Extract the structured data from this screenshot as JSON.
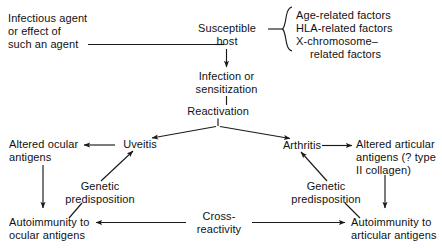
{
  "diagram": {
    "type": "flowchart",
    "title": "",
    "colors": {
      "background": "#ffffff",
      "text": "#111111",
      "stroke": "#1a1a1a"
    },
    "nodes": [
      {
        "id": "infectious-agent",
        "lines": [
          "Infectious agent",
          "or effect of",
          "such an agent"
        ]
      },
      {
        "id": "susceptible-host",
        "lines": [
          "Susceptible",
          "host"
        ]
      },
      {
        "id": "age-related-factors",
        "lines": [
          "Age-related factors"
        ]
      },
      {
        "id": "hla-related-factors",
        "lines": [
          "HLA-related factors"
        ]
      },
      {
        "id": "x-chromosome-factors",
        "lines": [
          "X-chromosome–",
          "related factors"
        ]
      },
      {
        "id": "infection-sensitization",
        "lines": [
          "Infection or",
          "sensitization"
        ]
      },
      {
        "id": "reactivation",
        "lines": [
          "Reactivation"
        ]
      },
      {
        "id": "uveitis",
        "lines": [
          "Uveitis"
        ]
      },
      {
        "id": "arthritis",
        "lines": [
          "Arthritis"
        ]
      },
      {
        "id": "altered-ocular-antigens",
        "lines": [
          "Altered ocular",
          "antigens"
        ]
      },
      {
        "id": "altered-articular-antigens",
        "lines": [
          "Altered articular",
          "antigens (? type",
          "II collagen)"
        ]
      },
      {
        "id": "genetic-predisposition-ocular",
        "lines": [
          "Genetic",
          "predisposition"
        ]
      },
      {
        "id": "genetic-predisposition-articular",
        "lines": [
          "Genetic",
          "predisposition"
        ]
      },
      {
        "id": "autoimmunity-ocular",
        "lines": [
          "Autoimmunity to",
          "ocular antigens"
        ]
      },
      {
        "id": "autoimmunity-articular",
        "lines": [
          "Autoimmunity to",
          "articular antigens"
        ]
      },
      {
        "id": "cross-reactivity",
        "lines": [
          "Cross-",
          "reactivity"
        ]
      }
    ],
    "edges": [
      {
        "from": "infectious-agent",
        "to": "susceptible-host",
        "style": "plain"
      },
      {
        "from": "susceptible-host",
        "to": "factor-brace",
        "style": "brace"
      },
      {
        "from": "susceptible-host",
        "to": "infection-sensitization",
        "style": "arrow"
      },
      {
        "from": "infection-sensitization",
        "to": "reactivation",
        "style": "plain"
      },
      {
        "from": "reactivation",
        "to": "uveitis",
        "style": "arrow"
      },
      {
        "from": "reactivation",
        "to": "arthritis",
        "style": "arrow"
      },
      {
        "from": "uveitis",
        "to": "altered-ocular-antigens",
        "style": "arrow"
      },
      {
        "from": "arthritis",
        "to": "altered-articular-antigens",
        "style": "arrow"
      },
      {
        "from": "altered-ocular-antigens",
        "to": "autoimmunity-ocular",
        "style": "arrow"
      },
      {
        "from": "altered-articular-antigens",
        "to": "autoimmunity-articular",
        "style": "arrow"
      },
      {
        "from": "genetic-predisposition-ocular",
        "to": "uveitis",
        "style": "arrow"
      },
      {
        "from": "genetic-predisposition-ocular",
        "to": "autoimmunity-ocular",
        "style": "plain"
      },
      {
        "from": "genetic-predisposition-articular",
        "to": "arthritis",
        "style": "arrow"
      },
      {
        "from": "genetic-predisposition-articular",
        "to": "autoimmunity-articular",
        "style": "plain"
      },
      {
        "from": "cross-reactivity",
        "to": "autoimmunity-ocular",
        "style": "arrow"
      },
      {
        "from": "cross-reactivity",
        "to": "autoimmunity-articular",
        "style": "arrow"
      }
    ]
  }
}
